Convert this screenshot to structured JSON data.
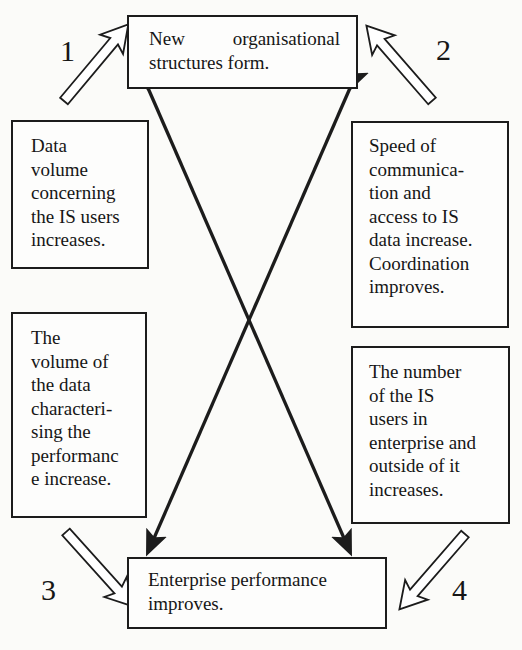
{
  "diagram": {
    "type": "cycle-with-cross-influences",
    "boxes": {
      "top": {
        "line1_words": [
          "New",
          "organisational"
        ],
        "text_rest": "structures form."
      },
      "left_top": {
        "text": "Data\nvolume\nconcerning\nthe IS users\nincreases."
      },
      "right_top": {
        "text": "Speed of\ncommunica-\ntion and\naccess to IS\ndata increase.\nCoordination\nimproves."
      },
      "left_bottom": {
        "text": "The\nvolume of\nthe data\ncharacteri-\nsing the\nperformanc\ne increase."
      },
      "right_bottom": {
        "text": "The number\nof the IS\nusers in\nenterprise and\noutside of it\nincreases."
      },
      "bottom": {
        "text": "Enterprise performance\nimproves."
      }
    },
    "labels": {
      "n1": "1",
      "n2": "2",
      "n3": "3",
      "n4": "4"
    },
    "hollow_arrows": [
      {
        "id": 1,
        "from": "left_top",
        "to": "top"
      },
      {
        "id": 2,
        "from": "right_top",
        "to": "top"
      },
      {
        "id": 3,
        "from": "left_bottom",
        "to": "bottom"
      },
      {
        "id": 4,
        "from": "right_bottom",
        "to": "bottom"
      }
    ],
    "cross_arrows": [
      {
        "from": "bottom-left",
        "to": "top-right",
        "style": "solid double-headed"
      },
      {
        "from": "bottom-right",
        "to": "top-left",
        "style": "solid double-headed"
      }
    ],
    "colors": {
      "ink": "#1c1c1c",
      "background": "#fbfbf9"
    }
  }
}
